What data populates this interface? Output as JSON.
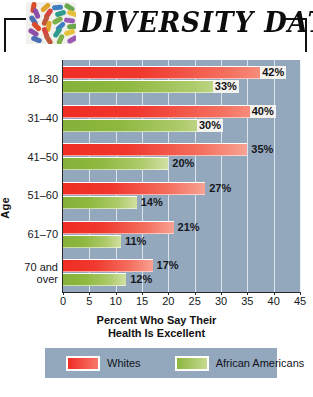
{
  "header": {
    "title": "DIVERSITY DATA",
    "logo_icon": "mosaic-tiles-icon",
    "logo_colors": [
      "#d94b2b",
      "#e0a32c",
      "#3f7fc1",
      "#6aa84f",
      "#8e4fa8",
      "#d6453f",
      "#2f9b8f",
      "#e8c13a",
      "#4a6fb5",
      "#c0563a",
      "#7bb04a",
      "#9b59b6"
    ]
  },
  "chart_data": {
    "type": "bar",
    "orientation": "horizontal",
    "title": "DIVERSITY DATA",
    "xlabel": "Percent Who Say Their Health Is Excellent",
    "xlabel_line1": "Percent Who Say Their",
    "xlabel_line2": "Health Is Excellent",
    "ylabel": "Age",
    "categories": [
      "18–30",
      "31–40",
      "41–50",
      "51–60",
      "61–70",
      "70 and over"
    ],
    "category_lines": [
      [
        "18–30"
      ],
      [
        "31–40"
      ],
      [
        "41–50"
      ],
      [
        "51–60"
      ],
      [
        "61–70"
      ],
      [
        "70 and",
        "over"
      ]
    ],
    "series": [
      {
        "name": "Whites",
        "color": "#ef2d24",
        "values": [
          42,
          40,
          35,
          27,
          21,
          17
        ],
        "value_labels": [
          "42%",
          "40%",
          "35%",
          "27%",
          "21%",
          "17%"
        ],
        "label_inside": [
          true,
          true,
          false,
          false,
          false,
          false
        ]
      },
      {
        "name": "African Americans",
        "color": "#8cb73f",
        "values": [
          33,
          30,
          20,
          14,
          11,
          12
        ],
        "value_labels": [
          "33%",
          "30%",
          "20%",
          "14%",
          "11%",
          "12%"
        ],
        "label_inside": [
          true,
          true,
          false,
          false,
          false,
          false
        ]
      }
    ],
    "xlim": [
      0,
      45
    ],
    "xticks": [
      0,
      5,
      10,
      15,
      20,
      25,
      30,
      35,
      40,
      45
    ],
    "xtick_labels": [
      "0",
      "5",
      "10",
      "15",
      "20",
      "25",
      "30",
      "35",
      "40",
      "45"
    ],
    "grid": true,
    "legend_position": "bottom",
    "plot_background": "#93a7bd",
    "gridline_color": "#e8eef5"
  },
  "legend": {
    "items": [
      {
        "label": "Whites",
        "color": "#ef2d24"
      },
      {
        "label": "African Americans",
        "color": "#8cb73f"
      }
    ]
  }
}
